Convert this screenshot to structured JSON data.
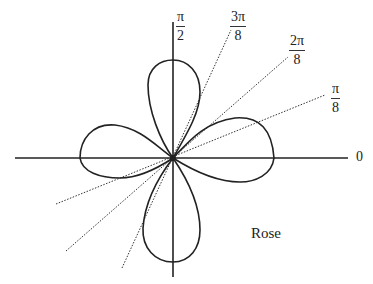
{
  "diagram": {
    "title": "Rose",
    "type": "polar rose curve (4 petals)",
    "axes": {
      "zero_label": "0",
      "vertical_label": {
        "num": "π",
        "den": "2"
      }
    },
    "rays": [
      {
        "num": "π",
        "den": "8"
      },
      {
        "num": "2π",
        "den": "8"
      },
      {
        "num": "3π",
        "den": "8"
      }
    ]
  }
}
